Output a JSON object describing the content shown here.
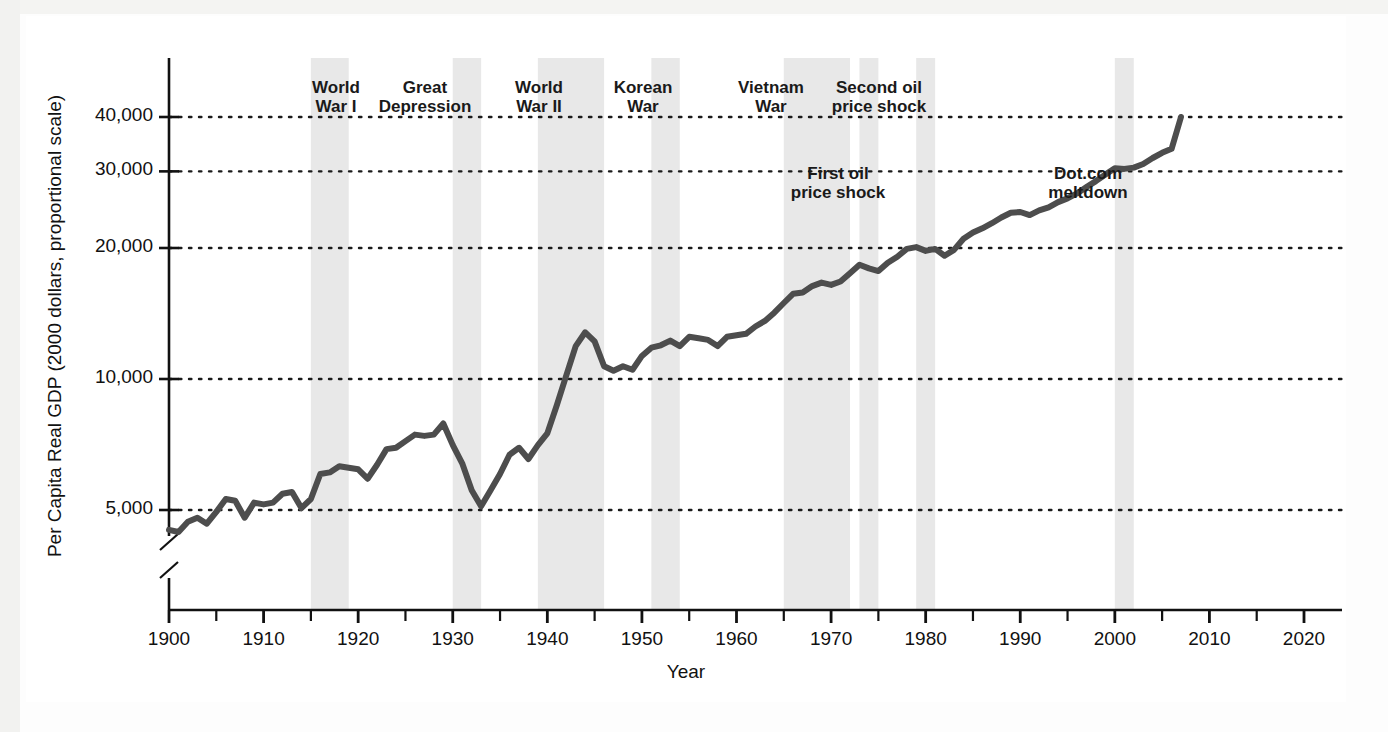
{
  "figure": {
    "kind": "line-chart-figure",
    "background_color": "#ffffff",
    "page_background_color": "#f2f2f0"
  },
  "axis": {
    "y_title": "Per Capita Real GDP (2000 dollars, proportional scale)",
    "x_title": "Year",
    "y_tick_labels": [
      "40,000",
      "30,000",
      "20,000",
      "10,000",
      "5,000"
    ],
    "y_tick_values": [
      40000,
      30000,
      20000,
      10000,
      5000
    ],
    "x_tick_labels": [
      "1900",
      "1910",
      "1920",
      "1930",
      "1940",
      "1950",
      "1960",
      "1970",
      "1980",
      "1990",
      "2000",
      "2010",
      "2020"
    ],
    "x_tick_values": [
      1900,
      1910,
      1920,
      1930,
      1940,
      1950,
      1960,
      1970,
      1980,
      1990,
      2000,
      2010,
      2020
    ],
    "y_axis_break": true,
    "y_scale": "log",
    "grid": "dotted-horizontal"
  },
  "annotations": [
    {
      "id": "world-war-i",
      "label": "World\nWar I",
      "x": 310,
      "y": 62,
      "band_start": 1915,
      "band_end": 1919
    },
    {
      "id": "great-depression",
      "label": "Great\nDepression",
      "x": 399,
      "y": 62,
      "band_start": 1930,
      "band_end": 1933
    },
    {
      "id": "world-war-ii",
      "label": "World\nWar II",
      "x": 513,
      "y": 62,
      "band_start": 1939,
      "band_end": 1946
    },
    {
      "id": "korean-war",
      "label": "Korean\nWar",
      "x": 617,
      "y": 62,
      "band_start": 1951,
      "band_end": 1954
    },
    {
      "id": "vietnam-war",
      "label": "Vietnam\nWar",
      "x": 745,
      "y": 62,
      "band_start": 1965,
      "band_end": 1972
    },
    {
      "id": "second-oil-shock",
      "label": "Second oil\nprice shock",
      "x": 853,
      "y": 62,
      "band_start": 1979,
      "band_end": 1981
    },
    {
      "id": "first-oil-shock",
      "label": "First oil\nprice shock",
      "x": 812,
      "y": 148,
      "band_start": 1973,
      "band_end": 1975
    },
    {
      "id": "dotcom-meltdown",
      "label": "Dot.com\nmeltdown",
      "x": 1062,
      "y": 148,
      "band_start": 2000,
      "band_end": 2002
    }
  ],
  "chart_data": {
    "type": "line",
    "title": "",
    "xlabel": "Year",
    "ylabel": "Per Capita Real GDP (2000 dollars, proportional scale)",
    "xlim": [
      1900,
      2020
    ],
    "ylim": [
      4000,
      45000
    ],
    "yscale": "log",
    "grid": true,
    "legend": "none",
    "line_color": "#4d4d4d",
    "series_name": "Per Capita Real GDP",
    "x": [
      1900,
      1901,
      1902,
      1903,
      1904,
      1905,
      1906,
      1907,
      1908,
      1909,
      1910,
      1911,
      1912,
      1913,
      1914,
      1915,
      1916,
      1917,
      1918,
      1919,
      1920,
      1921,
      1922,
      1923,
      1924,
      1925,
      1926,
      1927,
      1928,
      1929,
      1930,
      1931,
      1932,
      1933,
      1934,
      1935,
      1936,
      1937,
      1938,
      1939,
      1940,
      1941,
      1942,
      1943,
      1944,
      1945,
      1946,
      1947,
      1948,
      1949,
      1950,
      1951,
      1952,
      1953,
      1954,
      1955,
      1956,
      1957,
      1958,
      1959,
      1960,
      1961,
      1962,
      1963,
      1964,
      1965,
      1966,
      1967,
      1968,
      1969,
      1970,
      1971,
      1972,
      1973,
      1974,
      1975,
      1976,
      1977,
      1978,
      1979,
      1980,
      1981,
      1982,
      1983,
      1984,
      1985,
      1986,
      1987,
      1988,
      1989,
      1990,
      1991,
      1992,
      1993,
      1994,
      1995,
      1996,
      1997,
      1998,
      1999,
      2000,
      2001,
      2002,
      2003,
      2004,
      2005,
      2006,
      2007
    ],
    "y": [
      4500,
      4450,
      4700,
      4800,
      4650,
      4950,
      5300,
      5250,
      4800,
      5200,
      5150,
      5200,
      5450,
      5500,
      5050,
      5300,
      6050,
      6100,
      6300,
      6250,
      6200,
      5900,
      6350,
      6900,
      6950,
      7200,
      7450,
      7400,
      7450,
      7900,
      7050,
      6400,
      5550,
      5100,
      5550,
      6050,
      6700,
      6950,
      6550,
      7050,
      7500,
      8700,
      10200,
      11900,
      12800,
      12200,
      10700,
      10450,
      10700,
      10500,
      11300,
      11800,
      11950,
      12250,
      11900,
      12500,
      12400,
      12300,
      11900,
      12500,
      12600,
      12700,
      13200,
      13600,
      14200,
      14950,
      15700,
      15800,
      16350,
      16650,
      16450,
      16750,
      17500,
      18300,
      17950,
      17700,
      18500,
      19100,
      19900,
      20100,
      19700,
      19900,
      19200,
      19800,
      21000,
      21700,
      22200,
      22800,
      23500,
      24100,
      24200,
      23800,
      24400,
      24800,
      25500,
      26000,
      26700,
      27600,
      28500,
      29500,
      30500,
      30400,
      30600,
      31200,
      32200,
      33100,
      33800,
      40000
    ],
    "recession_bands": [
      {
        "label": "World War I",
        "start": 1915,
        "end": 1919
      },
      {
        "label": "Great Depression",
        "start": 1930,
        "end": 1933
      },
      {
        "label": "World War II",
        "start": 1939,
        "end": 1946
      },
      {
        "label": "Korean War",
        "start": 1951,
        "end": 1954
      },
      {
        "label": "Vietnam War",
        "start": 1965,
        "end": 1972
      },
      {
        "label": "First oil price shock",
        "start": 1973,
        "end": 1975
      },
      {
        "label": "Second oil price shock",
        "start": 1979,
        "end": 1981
      },
      {
        "label": "Dot.com meltdown",
        "start": 2000,
        "end": 2002
      }
    ]
  }
}
